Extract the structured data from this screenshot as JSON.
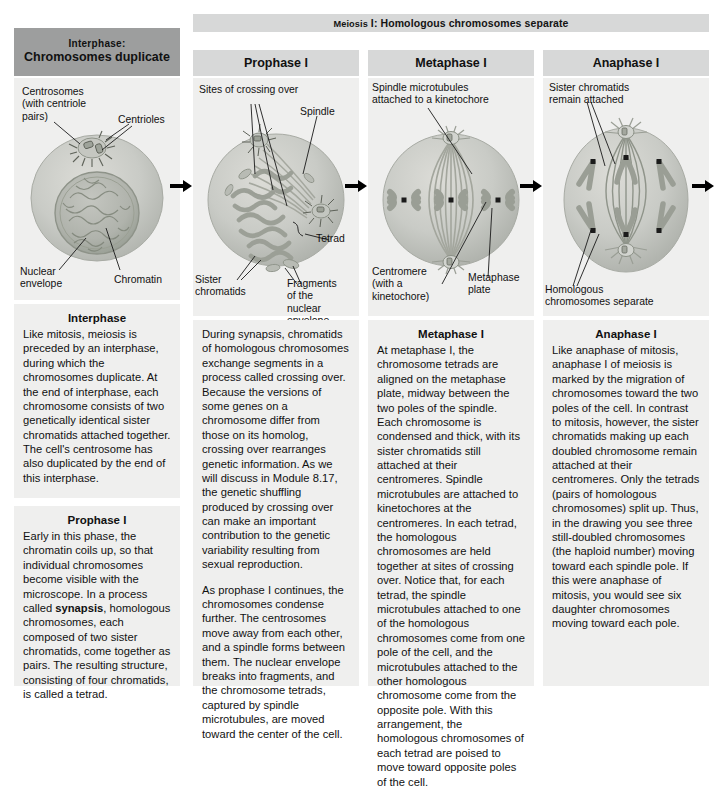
{
  "figure": {
    "meiosis_banner": {
      "smallcaps": "Meiosis",
      "rest": " I: Homologous chromosomes separate"
    }
  },
  "interphase": {
    "header_line1": "Interphase:",
    "header_line2": "Chromosomes duplicate",
    "labels": {
      "centrosomes": "Centrosomes\n(with centriole\npairs)",
      "centrioles": "Centrioles",
      "nuclear_envelope": "Nuclear\nenvelope",
      "chromatin": "Chromatin"
    },
    "body_title": "Interphase",
    "body_text": "Like mitosis, meiosis is preceded by an interphase, during which the chromosomes duplicate. At the end of interphase, each chromosome consists of two genetically identical sister chromatids attached together. The cell's centrosome has also duplicated by the end of this interphase.",
    "prophase_title": "Prophase I",
    "prophase_text_a": "Early in this phase, the chromatin coils up, so that individual chromosomes become visible with the microscope. In a process called ",
    "prophase_bold": "synapsis",
    "prophase_text_b": ", homologous chromosomes, each composed of two sister chromatids, come together as pairs. The resulting structure, consisting of four chromatids, is called a tetrad."
  },
  "prophase": {
    "header": "Prophase I",
    "labels": {
      "sites_crossing_over": "Sites of crossing over",
      "spindle": "Spindle",
      "tetrad": "Tetrad",
      "sister_chromatids": "Sister\nchromatids",
      "fragments": "Fragments\nof the\nnuclear\nenvelope"
    },
    "body_text_1": "During synapsis, chromatids of homologous chromosomes exchange segments in a process called crossing over. Because the versions of some genes on a chromosome differ from those on its homolog, crossing over rearranges genetic information. As we will discuss in Module 8.17, the genetic shuffling produced by crossing over can make an important contribution to the genetic variability resulting from sexual reproduction.",
    "body_text_2": "As prophase I continues, the chromosomes condense further. The centrosomes move away from each other, and a spindle forms between them. The nuclear envelope breaks into fragments, and the chromosome tetrads, captured by spindle microtubules, are moved toward the center of the cell."
  },
  "metaphase": {
    "header": "Metaphase I",
    "labels": {
      "spindle_microtubules": "Spindle microtubules\nattached to a kinetochore",
      "centromere": "Centromere\n(with a\nkinetochore)",
      "metaphase_plate": "Metaphase\nplate"
    },
    "body_title": "Metaphase I",
    "body_text": "At metaphase I, the chromosome tetrads are aligned on the metaphase plate, midway between the two poles of the spindle. Each chromosome is condensed and thick, with its sister chromatids still attached at their centromeres. Spindle microtubules are attached to kinetochores at the centromeres. In each tetrad, the homologous chromosomes are held together at sites of crossing over. Notice that, for each tetrad, the spindle microtubules attached to one of the homologous chromosomes come from one pole of the cell, and the microtubules attached to the other homologous chromosome come from the opposite pole. With this arrangement, the homologous chromosomes of each tetrad are poised to move toward opposite poles of the cell."
  },
  "anaphase": {
    "header": "Anaphase I",
    "labels": {
      "sister_chromatids": "Sister chromatids\nremain attached",
      "homologous_separate": "Homologous\nchromosomes separate"
    },
    "body_title": "Anaphase I",
    "body_text": "Like anaphase of mitosis, anaphase I of meiosis is marked by the migration of chromosomes toward the two poles of the cell. In contrast to mitosis, however, the sister chromatids making up each doubled chromosome remain attached at their centromeres. Only the tetrads (pairs of homologous chromosomes) split up. Thus, in the drawing you see three still-doubled chromosomes (the haploid number) moving toward each spindle pole. If this were anaphase of mitosis, you would see six daughter chromosomes moving toward each pole."
  },
  "colors": {
    "header_dark": "#9d9e9e",
    "header_light": "#d7d8d8",
    "panel_bg": "#efefee",
    "cell_fill": "#c9cbc6",
    "nucleus_fill": "#b4b7b0",
    "arrow": "#000000"
  }
}
